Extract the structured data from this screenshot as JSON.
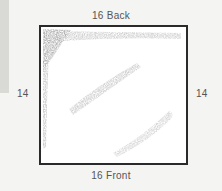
{
  "diagram": {
    "top_label": "16 Back",
    "bottom_label": "16 Front",
    "left_label": "14",
    "right_label": "14",
    "colors": {
      "frame": "#2a2a2a",
      "shading": "#9a9a9a",
      "label": "#555555",
      "page_bg": "#f4f4f2",
      "side_bar": "#d9d9d6"
    }
  }
}
